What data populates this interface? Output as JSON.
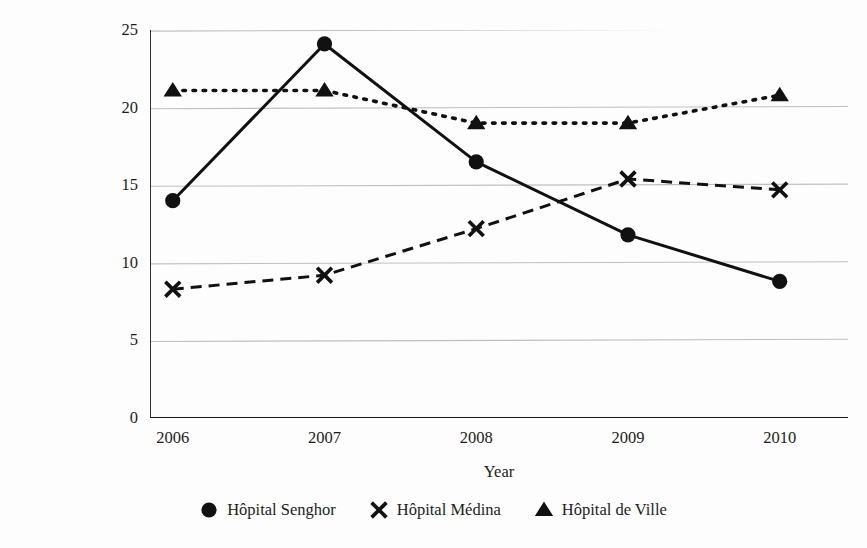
{
  "chart_data": {
    "type": "line",
    "title": "",
    "xlabel": "Year",
    "ylabel": "Percentage of admissions (%)",
    "categories": [
      "2006",
      "2007",
      "2008",
      "2009",
      "2010"
    ],
    "x": [
      2006,
      2007,
      2008,
      2009,
      2010
    ],
    "xlim": [
      2005.85,
      2010.45
    ],
    "ylim": [
      0,
      25
    ],
    "yticks": [
      0,
      5,
      10,
      15,
      20,
      25
    ],
    "ytick_labels": [
      "0",
      "5",
      "10",
      "15",
      "20",
      "25"
    ],
    "xtick_labels": [
      "2006",
      "2007",
      "2008",
      "2009",
      "2010"
    ],
    "grid": "horizontal",
    "legend_position": "below-center",
    "series": [
      {
        "name": "Hôpital Senghor",
        "marker": "circle",
        "linestyle": "solid",
        "color": "#111111",
        "values": [
          14.0,
          24.1,
          16.5,
          11.8,
          8.8
        ]
      },
      {
        "name": "Hôpital Médina",
        "marker": "x",
        "linestyle": "dashed",
        "color": "#111111",
        "values": [
          8.3,
          9.2,
          12.2,
          15.4,
          14.7
        ]
      },
      {
        "name": "Hôpital de Ville",
        "marker": "triangle",
        "linestyle": "dotted",
        "color": "#111111",
        "values": [
          21.1,
          21.1,
          19.0,
          19.0,
          20.8
        ]
      }
    ]
  },
  "legend": {
    "items": [
      {
        "label": "Hôpital Senghor",
        "marker": "circle-marker-icon"
      },
      {
        "label": "Hôpital Médina",
        "marker": "x-marker-icon"
      },
      {
        "label": "Hôpital de Ville",
        "marker": "triangle-marker-icon"
      }
    ]
  },
  "axes": {
    "y_title": "Percentage of admissions (%)",
    "x_title": "Year"
  },
  "colors": {
    "ink": "#111111",
    "gridline": "#bfbfbf",
    "axis": "#1a1a1a",
    "background": "#fdfdfd"
  }
}
